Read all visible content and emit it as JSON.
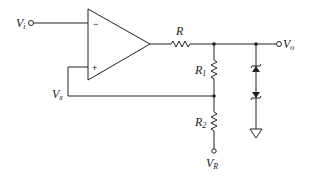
{
  "diagram": {
    "type": "circuit-schematic",
    "labels": {
      "vi": {
        "main": "V",
        "sub": "i"
      },
      "vo": {
        "main": "V",
        "sub": "o"
      },
      "vx": {
        "main": "V",
        "sub": "x"
      },
      "vr": {
        "main": "V",
        "sub": "R"
      },
      "r": {
        "main": "R",
        "sub": ""
      },
      "r1": {
        "main": "R",
        "sub": "1"
      },
      "r2": {
        "main": "R",
        "sub": "2"
      }
    },
    "opamp": {
      "inverting_sign": "−",
      "noninverting_sign": "+"
    },
    "components": [
      {
        "id": "opamp",
        "kind": "op-amp"
      },
      {
        "id": "R",
        "kind": "resistor",
        "between": [
          "opamp-output",
          "node-out"
        ]
      },
      {
        "id": "R1",
        "kind": "resistor",
        "between": [
          "node-out",
          "node-vx"
        ]
      },
      {
        "id": "R2",
        "kind": "resistor",
        "between": [
          "node-vx",
          "VR"
        ]
      },
      {
        "id": "D1",
        "kind": "zener-diode",
        "between": [
          "Vo",
          "D2"
        ]
      },
      {
        "id": "D2",
        "kind": "zener-diode",
        "between": [
          "D1",
          "ground"
        ]
      },
      {
        "id": "GND",
        "kind": "ground"
      }
    ],
    "connections": [
      "Vi -> opamp inverting input",
      "opamp noninverting input -> Vx node",
      "Vx node -> junction of R1 and R2",
      "back-to-back Zeners from Vo to ground"
    ]
  }
}
